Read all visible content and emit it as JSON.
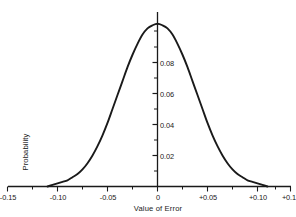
{
  "chart_data": {
    "type": "line",
    "title": "",
    "subtitle": "",
    "xlabel": "Value of Error",
    "ylabel": "Probability",
    "grid": false,
    "legend": null,
    "curve_description": "normal (Gaussian) probability distribution of error, centered at 0",
    "xlim": [
      -0.175,
      0.175
    ],
    "ylim": [
      0,
      0.112
    ],
    "x_ticks_major": [
      -0.15,
      -0.1,
      -0.05,
      0,
      0.05,
      0.1,
      0.15
    ],
    "x_tick_labels": [
      "-0.15",
      "-0.10",
      "-0.05",
      "0",
      "+0.05",
      "+0.10",
      "+0.15"
    ],
    "x_ticks_minor": [
      -0.175,
      -0.125,
      -0.075,
      -0.025,
      0.025,
      0.075,
      0.125,
      0.175
    ],
    "y_ticks_major": [
      0.02,
      0.04,
      0.06,
      0.08
    ],
    "y_tick_labels": [
      "0.02",
      "0.04",
      "0.06",
      "0.08"
    ],
    "y_ticks_minor": [
      0.01,
      0.03,
      0.05,
      0.07,
      0.09,
      0.1
    ],
    "peak_value": 0.105,
    "peak_x": 0,
    "sigma": 0.038,
    "x": [
      -0.11,
      -0.105,
      -0.1,
      -0.095,
      -0.09,
      -0.085,
      -0.08,
      -0.075,
      -0.07,
      -0.065,
      -0.06,
      -0.055,
      -0.05,
      -0.045,
      -0.04,
      -0.035,
      -0.03,
      -0.025,
      -0.02,
      -0.015,
      -0.01,
      -0.005,
      0.0,
      0.005,
      0.01,
      0.015,
      0.02,
      0.025,
      0.03,
      0.035,
      0.04,
      0.045,
      0.05,
      0.055,
      0.06,
      0.065,
      0.07,
      0.075,
      0.08,
      0.085,
      0.09,
      0.095,
      0.1,
      0.105,
      0.11
    ],
    "y": [
      0.0,
      0.001,
      0.002,
      0.003,
      0.004,
      0.006,
      0.008,
      0.011,
      0.015,
      0.02,
      0.026,
      0.033,
      0.041,
      0.05,
      0.059,
      0.068,
      0.077,
      0.085,
      0.092,
      0.098,
      0.102,
      0.104,
      0.105,
      0.104,
      0.102,
      0.098,
      0.092,
      0.085,
      0.077,
      0.068,
      0.059,
      0.05,
      0.041,
      0.033,
      0.026,
      0.02,
      0.015,
      0.011,
      0.008,
      0.006,
      0.004,
      0.003,
      0.002,
      0.001,
      0.0
    ],
    "colors": {
      "curve": "#1a1a1a",
      "axis": "#1a1a1a",
      "background": "#ffffff"
    }
  }
}
